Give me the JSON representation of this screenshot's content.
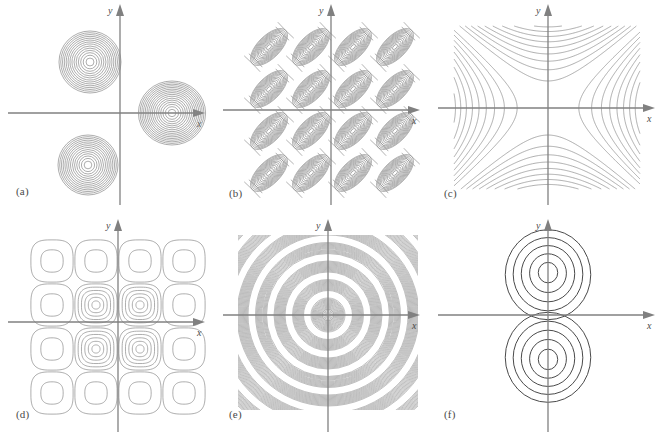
{
  "figure": {
    "title": "",
    "background_color": "#ffffff",
    "axis_color": "#808080",
    "contour_color_light": "#8a8a8a",
    "contour_color_dark": "#4a4a4a",
    "label_color": "#4a4a4a",
    "panel_count": 6
  },
  "axes": {
    "x_label": "x",
    "y_label": "y"
  },
  "panels": [
    {
      "id": "a",
      "label": "(a)",
      "origin": {
        "x": 120,
        "y": 113
      },
      "plot_box": {
        "x": 8,
        "y": 10,
        "w": 200,
        "h": 195
      },
      "description": "three gaussian peaks",
      "chart": {
        "type": "contour",
        "kind": "gaussian-blobs",
        "blobs": [
          {
            "cx": 90,
            "cy": 62,
            "r_max": 31,
            "rings": 14,
            "aspect": 1.0
          },
          {
            "cx": 88,
            "cy": 165,
            "r_max": 30,
            "rings": 14,
            "aspect": 1.0
          },
          {
            "cx": 172,
            "cy": 113,
            "r_max": 32,
            "rings": 16,
            "aspect": 1.05
          }
        ]
      }
    },
    {
      "id": "b",
      "label": "(b)",
      "origin": {
        "x": 116,
        "y": 110
      },
      "plot_box": {
        "x": 33,
        "y": 26,
        "w": 168,
        "h": 168
      },
      "description": "grid of tilted elliptical peaks",
      "chart": {
        "type": "contour",
        "kind": "tilted-ellipse-grid",
        "cols": 4,
        "rows": 4,
        "cell_w": 42,
        "cell_h": 42,
        "rings": 12,
        "tilt_deg": -45,
        "ellipse_ratio": 0.48
      }
    },
    {
      "id": "c",
      "label": "(c)",
      "origin": {
        "x": 118,
        "y": 108
      },
      "plot_box": {
        "x": 24,
        "y": 26,
        "w": 186,
        "h": 163
      },
      "description": "hyperbolic saddle contours",
      "chart": {
        "type": "contour",
        "kind": "saddle",
        "levels": 16,
        "level_step": 0.11
      }
    },
    {
      "id": "d",
      "label": "(d)",
      "origin": {
        "x": 118,
        "y": 107
      },
      "plot_box": {
        "x": 30,
        "y": 24,
        "w": 176,
        "h": 176
      },
      "description": "grid of rounded-square cells, centre cells strongest",
      "chart": {
        "type": "contour",
        "kind": "rounded-square-grid",
        "cols": 4,
        "rows": 4,
        "cell": 44,
        "rings_outer": 2,
        "rings_inner": 6,
        "superellipse_n": 3.2
      }
    },
    {
      "id": "e",
      "label": "(e)",
      "origin": {
        "x": 113,
        "y": 100
      },
      "plot_box": {
        "x": 23,
        "y": 20,
        "w": 180,
        "h": 175
      },
      "description": "dense concentric rings, radial oscillation",
      "chart": {
        "type": "contour",
        "kind": "concentric-dense-rings",
        "bands": 7,
        "lines_per_band": 13,
        "band_spacing": 18.5,
        "band_thickness": 11
      }
    },
    {
      "id": "f",
      "label": "(f)",
      "origin": {
        "x": 118,
        "y": 100
      },
      "plot_box": {
        "x": 30,
        "y": 18,
        "w": 180,
        "h": 180
      },
      "description": "two lobes of concentric contours above and below x-axis",
      "chart": {
        "type": "contour",
        "kind": "dipole-lobes",
        "lobes": [
          {
            "cx": 118,
            "cy": 57,
            "rings": 5,
            "r_max": 45,
            "squash": 0.95
          },
          {
            "cx": 118,
            "cy": 145,
            "rings": 5,
            "r_max": 45,
            "squash": 0.95
          }
        ]
      }
    }
  ]
}
